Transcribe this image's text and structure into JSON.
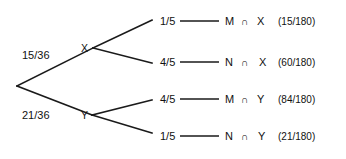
{
  "diagram": {
    "type": "probability-tree",
    "background_color": "#ffffff",
    "line_color": "#1a1a1a",
    "text_color": "#111111",
    "intersection_symbol": "∩",
    "root": {
      "x": 17,
      "y": 86
    },
    "level1": [
      {
        "id": "x",
        "node_label": "X",
        "probability": "15/36",
        "node_x": 81,
        "node_y": 48,
        "vertex_x": 93,
        "vertex_y": 48,
        "prob_x": 22,
        "prob_y": 59
      },
      {
        "id": "y",
        "node_label": "Y",
        "probability": "21/36",
        "node_x": 81,
        "node_y": 119,
        "vertex_x": 92,
        "vertex_y": 115,
        "prob_x": 22,
        "prob_y": 119
      }
    ],
    "leaves": [
      {
        "id": "mx",
        "parent": "x",
        "probability": "1/5",
        "event_first": "M",
        "event_second": "X",
        "result": "(15/180)",
        "branch_end_x": 152,
        "branch_end_y": 20,
        "prob_x": 160,
        "prob_y": 25,
        "line_start_x": 180,
        "line_end_x": 219,
        "line_y": 21,
        "first_x": 225,
        "op_x": 241,
        "second_x": 257,
        "result_x": 278,
        "text_y": 25
      },
      {
        "id": "nx",
        "parent": "x",
        "probability": "4/5",
        "event_first": "N",
        "event_second": "X",
        "result": "(60/180)",
        "branch_end_x": 152,
        "branch_end_y": 63,
        "prob_x": 160,
        "prob_y": 66,
        "line_start_x": 180,
        "line_end_x": 219,
        "line_y": 62,
        "first_x": 225,
        "op_x": 241,
        "second_x": 259,
        "result_x": 278,
        "text_y": 66
      },
      {
        "id": "my",
        "parent": "y",
        "probability": "4/5",
        "event_first": "M",
        "event_second": "Y",
        "result": "(84/180)",
        "branch_end_x": 152,
        "branch_end_y": 100,
        "prob_x": 160,
        "prob_y": 103,
        "line_start_x": 180,
        "line_end_x": 219,
        "line_y": 99,
        "first_x": 225,
        "op_x": 241,
        "second_x": 257,
        "result_x": 278,
        "text_y": 103
      },
      {
        "id": "ny",
        "parent": "y",
        "probability": "1/5",
        "event_first": "N",
        "event_second": "Y",
        "result": "(21/180)",
        "branch_end_x": 152,
        "branch_end_y": 133,
        "prob_x": 160,
        "prob_y": 140,
        "line_start_x": 180,
        "line_end_x": 219,
        "line_y": 136,
        "first_x": 225,
        "op_x": 241,
        "second_x": 258,
        "result_x": 278,
        "text_y": 140
      }
    ]
  }
}
